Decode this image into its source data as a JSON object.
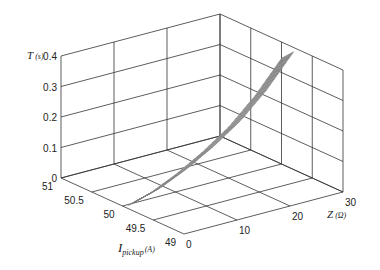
{
  "chart_data": {
    "type": "surface3d",
    "title": "",
    "axes": {
      "x": {
        "label": "I",
        "label_sub": "pickup",
        "label_unit": "(A)",
        "ticks": [
          49,
          49.5,
          50,
          50.5,
          51
        ],
        "range": [
          49,
          51
        ]
      },
      "y": {
        "label": "Z",
        "label_unit": "(Ω)",
        "ticks": [
          0,
          10,
          20,
          30
        ],
        "range": [
          0,
          30
        ]
      },
      "z": {
        "label": "T",
        "label_unit": "(s)",
        "ticks": [
          0,
          0.1,
          0.2,
          0.3,
          0.4
        ],
        "range": [
          0,
          0.4
        ]
      }
    },
    "grid": true,
    "surface": {
      "I_range": [
        49.8,
        50.0
      ],
      "Z_range": [
        1,
        30
      ],
      "T_at_Z": [
        {
          "Z": 1,
          "T": 0.02
        },
        {
          "Z": 5,
          "T": 0.04
        },
        {
          "Z": 10,
          "T": 0.08
        },
        {
          "Z": 15,
          "T": 0.13
        },
        {
          "Z": 20,
          "T": 0.19
        },
        {
          "Z": 25,
          "T": 0.27
        },
        {
          "Z": 30,
          "T": 0.37
        }
      ],
      "thickness_T": 0.04
    },
    "colormap": "grayscale"
  }
}
